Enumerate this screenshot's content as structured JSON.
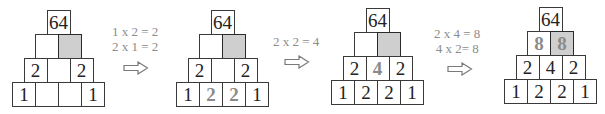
{
  "diagram": {
    "cell_width": 23,
    "cell_height": 24,
    "colors": {
      "border": "#3a3a3a",
      "shaded": "#cfcfcf",
      "text": "#222222",
      "new_value_text": "#8a8a8a",
      "equation_text": "#8c8c8c"
    },
    "pyramids": [
      {
        "name": "pyramid-1",
        "origin": {
          "x": 12,
          "y": 10
        },
        "rows": [
          [
            {
              "v": "64"
            }
          ],
          [
            {
              "v": ""
            },
            {
              "v": "",
              "shaded": true
            }
          ],
          [
            {
              "v": "2"
            },
            {
              "v": ""
            },
            {
              "v": "2"
            }
          ],
          [
            {
              "v": "1"
            },
            {
              "v": ""
            },
            {
              "v": ""
            },
            {
              "v": "1"
            }
          ]
        ]
      },
      {
        "name": "pyramid-2",
        "origin": {
          "x": 176,
          "y": 10
        },
        "rows": [
          [
            {
              "v": "64"
            }
          ],
          [
            {
              "v": ""
            },
            {
              "v": "",
              "shaded": true
            }
          ],
          [
            {
              "v": "2"
            },
            {
              "v": ""
            },
            {
              "v": "2"
            }
          ],
          [
            {
              "v": "1"
            },
            {
              "v": "2",
              "new": true
            },
            {
              "v": "2",
              "new": true
            },
            {
              "v": "1"
            }
          ]
        ]
      },
      {
        "name": "pyramid-3",
        "origin": {
          "x": 331,
          "y": 8
        },
        "rows": [
          [
            {
              "v": "64"
            }
          ],
          [
            {
              "v": ""
            },
            {
              "v": "",
              "shaded": true
            }
          ],
          [
            {
              "v": "2"
            },
            {
              "v": "4",
              "new": true
            },
            {
              "v": "2"
            }
          ],
          [
            {
              "v": "1"
            },
            {
              "v": "2"
            },
            {
              "v": "2"
            },
            {
              "v": "1"
            }
          ]
        ]
      },
      {
        "name": "pyramid-4",
        "origin": {
          "x": 504,
          "y": 7
        },
        "rows": [
          [
            {
              "v": "64"
            }
          ],
          [
            {
              "v": "8",
              "new": true
            },
            {
              "v": "8",
              "shaded": true,
              "new": true
            }
          ],
          [
            {
              "v": "2"
            },
            {
              "v": "4"
            },
            {
              "v": "2"
            }
          ],
          [
            {
              "v": "1"
            },
            {
              "v": "2"
            },
            {
              "v": "2"
            },
            {
              "v": "1"
            }
          ]
        ]
      }
    ],
    "steps": [
      {
        "name": "step-1",
        "lines": [
          "1 x 2 = 2",
          "2 x 1 = 2"
        ],
        "text_pos": {
          "x": 112,
          "y": 24
        },
        "arrow_pos": {
          "x": 123,
          "y": 61
        }
      },
      {
        "name": "step-2",
        "lines": [
          "2 x 2 = 4"
        ],
        "text_pos": {
          "x": 273,
          "y": 34
        },
        "arrow_pos": {
          "x": 284,
          "y": 55
        }
      },
      {
        "name": "step-3",
        "lines": [
          "2 x 4 = 8",
          "4 x 2= 8"
        ],
        "text_pos": {
          "x": 434,
          "y": 26
        },
        "arrow_pos": {
          "x": 447,
          "y": 62
        }
      }
    ]
  }
}
